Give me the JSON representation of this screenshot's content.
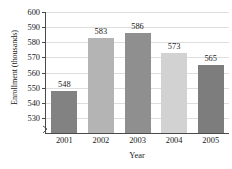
{
  "chart_data": {
    "type": "bar",
    "title": "",
    "xlabel": "Year",
    "ylabel": "Enrollment (thousands)",
    "categories": [
      "2001",
      "2002",
      "2003",
      "2004",
      "2005"
    ],
    "values": [
      548,
      583,
      586,
      573,
      565
    ],
    "value_labels": [
      "548",
      "583",
      "586",
      "573",
      "565"
    ],
    "ylim": [
      520,
      600
    ],
    "ytick_labels": [
      "530",
      "540",
      "550",
      "560",
      "570",
      "580",
      "590",
      "600"
    ],
    "yticks": [
      530,
      540,
      550,
      560,
      570,
      580,
      590,
      600
    ],
    "grid": true,
    "legend": "none",
    "axis_break": true,
    "bar_colors": [
      "#828282",
      "#b4b4b4",
      "#8f8f8f",
      "#d2d2d2",
      "#7d7d7d"
    ],
    "background": "#ffffff",
    "axis_color": "#4a4a4a",
    "grid_color": "#dedede"
  }
}
